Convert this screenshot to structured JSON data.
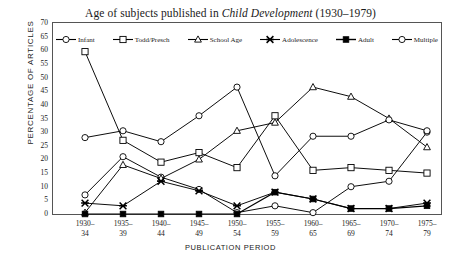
{
  "chart_data": {
    "type": "line",
    "title": "Age of subjects published in Child Development (1930–1979)",
    "title_plain": "Age of subjects published in ",
    "title_italic": "Child Development",
    "title_tail": " (1930–1979)",
    "xlabel": "PUBLICATION PERIOD",
    "ylabel": "PERCENTAGE OF ARTICLES",
    "ylim": [
      0,
      70
    ],
    "ytick_step": 5,
    "yticks": [
      70,
      65,
      60,
      55,
      50,
      45,
      40,
      35,
      30,
      25,
      20,
      15,
      10,
      5,
      0
    ],
    "grid": false,
    "legend_position": "top-inside",
    "categories": [
      "1930–\n34",
      "1935–\n39",
      "1940–\n44",
      "1945–\n49",
      "1950–\n54",
      "1955–\n59",
      "1960–\n65",
      "1965–\n69",
      "1970–\n74",
      "1975–\n79"
    ],
    "categories_line1": [
      "1930–",
      "1935–",
      "1940–",
      "1945–",
      "1950–",
      "1955–",
      "1960–",
      "1965–",
      "1970–",
      "1975–"
    ],
    "categories_line2": [
      "34",
      "39",
      "44",
      "49",
      "54",
      "59",
      "65",
      "69",
      "74",
      "79"
    ],
    "series": [
      {
        "name": "Infant",
        "marker": "open-circle",
        "values": [
          7,
          21,
          13.5,
          9,
          0.5,
          3,
          0.5,
          10,
          12,
          30
        ]
      },
      {
        "name": "Todd/Presch",
        "marker": "open-square",
        "values": [
          59.5,
          27,
          19,
          22.5,
          17,
          36,
          16,
          17,
          16,
          15
        ]
      },
      {
        "name": "School Age",
        "marker": "open-triangle",
        "values": [
          0.5,
          18,
          13,
          20,
          30.5,
          33.5,
          46.5,
          43,
          35,
          24.5
        ]
      },
      {
        "name": "Adolescence",
        "marker": "cross-star",
        "values": [
          4,
          3,
          12,
          8.5,
          3,
          8,
          5.5,
          2,
          2,
          4
        ]
      },
      {
        "name": "Adult",
        "marker": "filled-square",
        "values": [
          0,
          0,
          0,
          0,
          0,
          8,
          5.5,
          2,
          2,
          3
        ]
      },
      {
        "name": "Multiple",
        "marker": "open-circle",
        "values": [
          28,
          30.5,
          26.5,
          36,
          46.5,
          14,
          28.5,
          28.5,
          34.5,
          30.5
        ]
      }
    ]
  },
  "colors": {
    "line": "#000000",
    "frame": "#555555",
    "background": "#ffffff"
  }
}
